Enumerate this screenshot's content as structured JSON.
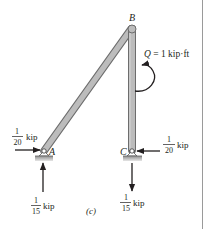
{
  "figure": {
    "caption": "(c)",
    "joints": {
      "A": {
        "label": "A"
      },
      "B": {
        "label": "B"
      },
      "C": {
        "label": "C"
      }
    },
    "moment": {
      "symbol": "Q",
      "equals": " = 1 kip·ft",
      "direction": "counterclockwise"
    },
    "reactions": {
      "A_horizontal": {
        "num": "1",
        "den": "20",
        "unit": "kip",
        "direction": "right"
      },
      "A_vertical": {
        "num": "1",
        "den": "15",
        "unit": "kip",
        "direction": "up"
      },
      "C_horizontal": {
        "num": "1",
        "den": "20",
        "unit": "kip",
        "direction": "left"
      },
      "C_vertical": {
        "num": "1",
        "den": "15",
        "unit": "kip",
        "direction": "down"
      }
    },
    "colors": {
      "member_fill": "#b9b9b9",
      "member_edge": "#6d6d6d",
      "ink": "#231f20",
      "ground": "#a7a7a7"
    }
  }
}
